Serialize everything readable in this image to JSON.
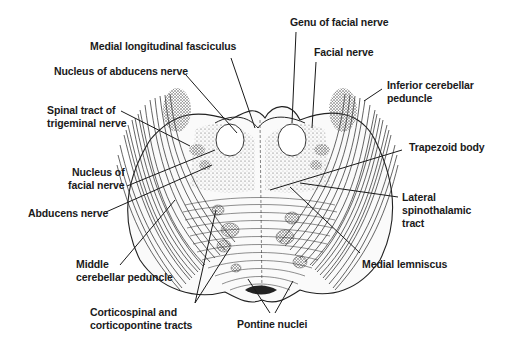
{
  "figure": {
    "labels": {
      "genu_facial_nerve": [
        "Genu of facial nerve"
      ],
      "medial_longitudinal_fasciculus": [
        "Medial longitudinal fasciculus"
      ],
      "facial_nerve": [
        "Facial nerve"
      ],
      "nucleus_abducens": [
        "Nucleus of abducens nerve"
      ],
      "inferior_cerebellar_peduncle": [
        "Inferior cerebellar",
        "peduncle"
      ],
      "spinal_tract_trigeminal": [
        "Spinal tract of",
        "trigeminal nerve"
      ],
      "trapezoid_body": [
        "Trapezoid body"
      ],
      "nucleus_facial": [
        "Nucleus of",
        "facial nerve"
      ],
      "abducens_nerve": [
        "Abducens nerve"
      ],
      "lateral_spinothalamic": [
        "Lateral",
        "spinothalamic",
        "tract"
      ],
      "middle_cerebellar_peduncle": [
        "Middle",
        "cerebellar peduncle"
      ],
      "medial_lemniscus": [
        "Medial lemniscus"
      ],
      "corticospinal": [
        "Corticospinal and",
        "corticopontine tracts"
      ],
      "pontine_nuclei": [
        "Pontine nuclei"
      ]
    },
    "colors": {
      "ink": "#1a1a1a",
      "background": "#ffffff",
      "stipple": "#555555"
    }
  }
}
